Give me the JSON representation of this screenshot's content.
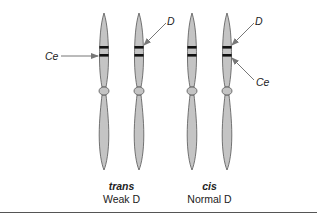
{
  "figure": {
    "colors": {
      "chromosome_fill": "#c4c4c4",
      "chromosome_stroke": "#555555",
      "band": "#111111",
      "arrow": "#777777",
      "text": "#222222",
      "rule": "#555555"
    },
    "groups": [
      {
        "id": "trans",
        "title": "trans",
        "subtitle": "Weak D",
        "chromosomes": [
          {
            "x": 104,
            "gene_label": "Ce",
            "label_side": "left"
          },
          {
            "x": 139,
            "gene_label": "D",
            "label_side": "right"
          }
        ]
      },
      {
        "id": "cis",
        "title": "cis",
        "subtitle": "Normal D",
        "chromosomes": [
          {
            "x": 192
          },
          {
            "x": 227,
            "gene_labels": [
              "D",
              "Ce"
            ]
          }
        ]
      }
    ],
    "labels": {
      "trans_ce": "Ce",
      "trans_d": "D",
      "cis_d": "D",
      "cis_ce": "Ce",
      "trans_title": "trans",
      "trans_subtitle": "Weak D",
      "cis_title": "cis",
      "cis_subtitle": "Normal D"
    }
  }
}
